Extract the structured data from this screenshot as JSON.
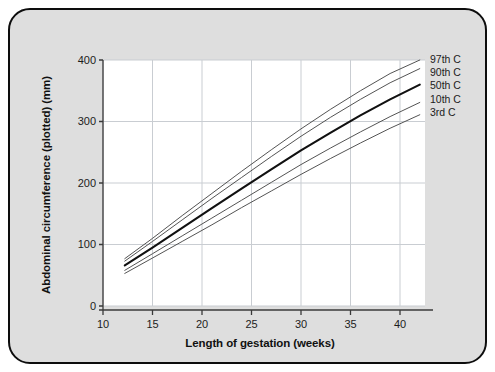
{
  "chart_data": {
    "type": "line",
    "title": "",
    "xlabel": "Length of gestation (weeks)",
    "ylabel": "Abdominal circumference (plotted) (mm)",
    "xlim": [
      8.5,
      43.5
    ],
    "ylim": [
      0,
      400
    ],
    "xticks": [
      10,
      15,
      20,
      25,
      30,
      35,
      40
    ],
    "yticks": [
      0,
      100,
      200,
      300,
      400
    ],
    "grid": true,
    "legend_position": "right",
    "x": [
      12.2,
      15,
      18,
      21,
      24,
      27,
      30,
      33,
      36,
      39,
      42
    ],
    "series": [
      {
        "name": "97th C",
        "label": "97th C",
        "emphasis": false,
        "values": [
          77,
          110,
          147,
          183,
          219,
          254,
          288,
          320,
          350,
          378,
          400
        ]
      },
      {
        "name": "90th C",
        "label": "90th C",
        "emphasis": false,
        "values": [
          73,
          105,
          140,
          175,
          209,
          243,
          276,
          307,
          336,
          363,
          386
        ]
      },
      {
        "name": "50th C",
        "label": "50th C",
        "emphasis": true,
        "values": [
          66,
          95,
          127,
          159,
          191,
          222,
          253,
          282,
          310,
          336,
          360
        ]
      },
      {
        "name": "10th C",
        "label": "10th C",
        "emphasis": false,
        "values": [
          58,
          85,
          114,
          143,
          172,
          201,
          230,
          257,
          283,
          308,
          331
        ]
      },
      {
        "name": "3rd C",
        "label": "3rd C",
        "emphasis": false,
        "values": [
          53,
          78,
          105,
          132,
          160,
          187,
          214,
          240,
          265,
          289,
          311
        ]
      }
    ]
  },
  "axes": {
    "x_title": "Length of gestation (weeks)",
    "y_title": "Abdominal circumference (plotted) (mm)",
    "x_tick_labels": [
      "10",
      "15",
      "20",
      "25",
      "30",
      "35",
      "40"
    ],
    "y_tick_labels": [
      "0",
      "100",
      "200",
      "300",
      "400"
    ]
  },
  "legend": {
    "entries": [
      "97th C",
      "90th C",
      "50th C",
      "10th C",
      "3rd C"
    ]
  },
  "colors": {
    "card_background": "#dedede",
    "card_border": "#0d0d0d",
    "plot_background": "#ffffff",
    "grid": "#c9cdd2",
    "axis": "#3a3a3a",
    "curve": "#4a4a4a",
    "curve_median": "#111111",
    "text": "#1c1c1c"
  }
}
